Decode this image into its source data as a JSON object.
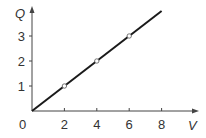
{
  "chart_data": {
    "type": "line",
    "title": "",
    "xlabel": "V",
    "ylabel": "Q",
    "origin_label": "0",
    "x_ticks": [
      2,
      4,
      6,
      8
    ],
    "y_ticks": [
      1,
      2,
      3
    ],
    "xlim": [
      0,
      10
    ],
    "ylim": [
      0,
      4.2
    ],
    "grid": false,
    "legend": null,
    "series": [
      {
        "name": "Q vs V",
        "line": {
          "x": [
            0,
            8
          ],
          "y": [
            0,
            4
          ]
        },
        "markers": {
          "x": [
            2,
            4,
            6
          ],
          "y": [
            1,
            2,
            3
          ],
          "style": "open-circle"
        }
      }
    ],
    "colors": {
      "axis": "#444444",
      "line": "#1a1a1a",
      "marker_fill": "#ffffff",
      "text": "#333333"
    }
  }
}
